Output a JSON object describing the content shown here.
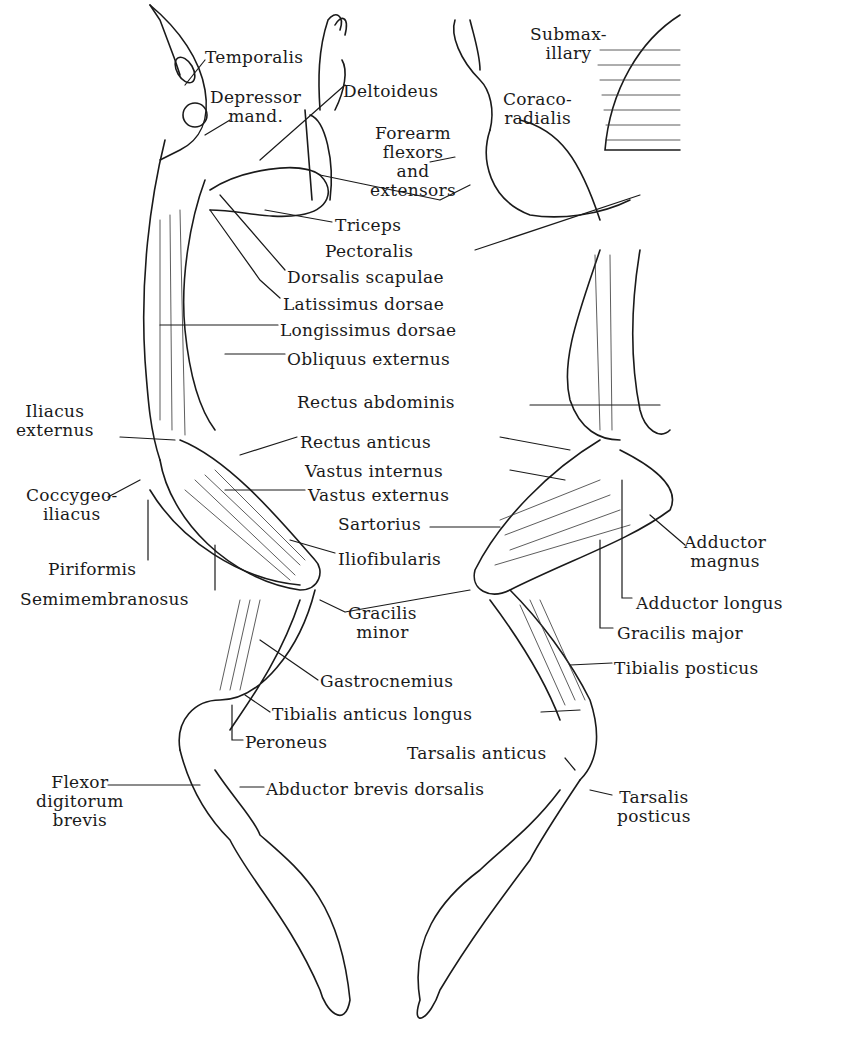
{
  "diagram": {
    "labels_left": [
      {
        "id": "temporalis",
        "text": "Temporalis",
        "x": 205,
        "y": 48
      },
      {
        "id": "depressor",
        "text": "Depressor\nmand.",
        "x": 210,
        "y": 88
      },
      {
        "id": "dorsalis",
        "text": "Dorsalis scapulae",
        "x": 287,
        "y": 268
      },
      {
        "id": "latissimus",
        "text": "Latissimus dorsae",
        "x": 283,
        "y": 295
      },
      {
        "id": "longissimus",
        "text": "Longissimus dorsae",
        "x": 280,
        "y": 321
      },
      {
        "id": "obliquus",
        "text": "Obliquus externus",
        "x": 287,
        "y": 350
      },
      {
        "id": "iliacus",
        "text": "Iliacus\nexternus",
        "x": 16,
        "y": 402
      },
      {
        "id": "coccygeo",
        "text": "Coccygeo-\niliacus",
        "x": 26,
        "y": 486
      },
      {
        "id": "vastus-ext",
        "text": "Vastus externus",
        "x": 308,
        "y": 486
      },
      {
        "id": "iliofibularis",
        "text": "Iliofibularis",
        "x": 338,
        "y": 550
      },
      {
        "id": "piriformis",
        "text": "Piriformis",
        "x": 48,
        "y": 560
      },
      {
        "id": "semimem",
        "text": "Semimembranosus",
        "x": 20,
        "y": 590
      },
      {
        "id": "gracilis-minor",
        "text": "Gracilis\nminor",
        "x": 348,
        "y": 604
      },
      {
        "id": "gastrocnemius",
        "text": "Gastrocnemius",
        "x": 320,
        "y": 672
      },
      {
        "id": "tibialis-ant",
        "text": "Tibialis anticus longus",
        "x": 272,
        "y": 705
      },
      {
        "id": "peroneus",
        "text": "Peroneus",
        "x": 245,
        "y": 733
      },
      {
        "id": "flexor",
        "text": "Flexor\ndigitorum\nbrevis",
        "x": 36,
        "y": 773
      },
      {
        "id": "abductor",
        "text": "Abductor brevis dorsalis",
        "x": 266,
        "y": 780
      }
    ],
    "labels_center": [
      {
        "id": "deltoideus",
        "text": "Deltoideus",
        "x": 343,
        "y": 82
      },
      {
        "id": "forearm",
        "text": "Forearm\nflexors\nand\nextensors",
        "x": 370,
        "y": 124
      },
      {
        "id": "triceps",
        "text": "Triceps",
        "x": 335,
        "y": 216
      },
      {
        "id": "pectoralis",
        "text": "Pectoralis",
        "x": 325,
        "y": 242
      },
      {
        "id": "rectus-abd",
        "text": "Rectus abdominis",
        "x": 297,
        "y": 393
      },
      {
        "id": "rectus-ant",
        "text": "Rectus anticus",
        "x": 300,
        "y": 433
      },
      {
        "id": "vastus-int",
        "text": "Vastus internus",
        "x": 305,
        "y": 462
      },
      {
        "id": "sartorius",
        "text": "Sartorius",
        "x": 338,
        "y": 515
      },
      {
        "id": "tarsalis-ant",
        "text": "Tarsalis anticus",
        "x": 407,
        "y": 744
      }
    ],
    "labels_right": [
      {
        "id": "submax",
        "text": "Submax-\nillary",
        "x": 530,
        "y": 25
      },
      {
        "id": "coraco",
        "text": "Coraco-\nradialis",
        "x": 503,
        "y": 90
      },
      {
        "id": "adductor-magnus",
        "text": "Adductor\nmagnus",
        "x": 684,
        "y": 533
      },
      {
        "id": "adductor-longus",
        "text": "Adductor longus",
        "x": 636,
        "y": 594
      },
      {
        "id": "gracilis-major",
        "text": "Gracilis major",
        "x": 617,
        "y": 624
      },
      {
        "id": "tibialis-post",
        "text": "Tibialis posticus",
        "x": 614,
        "y": 659
      },
      {
        "id": "tarsalis-post",
        "text": "Tarsalis\nposticus",
        "x": 617,
        "y": 788
      }
    ]
  }
}
